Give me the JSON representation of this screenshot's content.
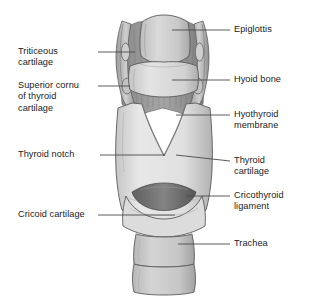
{
  "figure": {
    "background_color": "#ffffff",
    "line_color": "#4a4a4a",
    "text_color": "#1b1b1b",
    "palette": {
      "cartilage_light": "#e3e3e3",
      "cartilage_mid": "#c9c9c9",
      "cartilage_shadow": "#a9a9a9",
      "membrane_dark": "#8e8e8e",
      "ligament_dark": "#6f6f6f",
      "outline": "#5a5a5a"
    }
  },
  "labels": {
    "epiglottis": "Epiglottis",
    "hyoid_bone": "Hyoid bone",
    "hyothyroid_membrane": "Hyothyroid\nmembrane",
    "thyroid_cartilage": "Thyroid\ncartilage",
    "cricothyroid_ligament": "Cricothyroid\nligament",
    "trachea": "Trachea",
    "triticeous_cartilage": "Triticeous\ncartilage",
    "superior_cornu": "Superior cornu\nof thyroid\ncartilage",
    "thyroid_notch": "Thyroid notch",
    "cricoid_cartilage": "Cricoid cartilage"
  }
}
